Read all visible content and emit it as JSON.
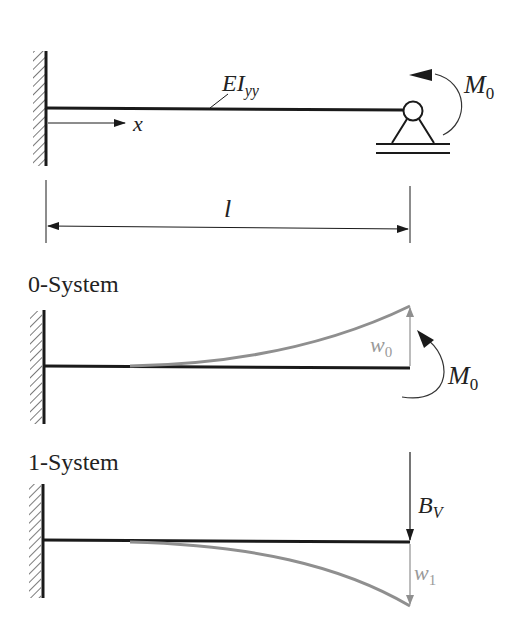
{
  "colors": {
    "beam": "#1a1a1a",
    "deflection": "#8f8f8f",
    "background": "#ffffff"
  },
  "top_system": {
    "beam_label_main": "EI",
    "beam_label_sub": "yy",
    "axis_label": "x",
    "moment_label_main": "M",
    "moment_label_sub": "0",
    "length_label": "l",
    "left_support": "fixed-wall",
    "right_support": "pin-on-roller"
  },
  "system_0": {
    "title": "0-System",
    "deflection_label_main": "w",
    "deflection_label_sub": "0",
    "moment_label_main": "M",
    "moment_label_sub": "0",
    "deflection_direction": "up"
  },
  "system_1": {
    "title": "1-System",
    "force_label_main": "B",
    "force_label_sub": "V",
    "deflection_label_main": "w",
    "deflection_label_sub": "1",
    "deflection_direction": "down"
  }
}
